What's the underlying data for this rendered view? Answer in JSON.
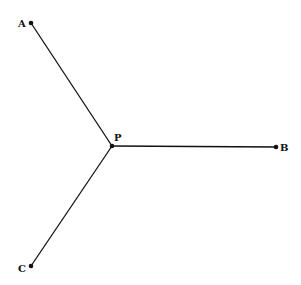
{
  "diagram": {
    "points": [
      {
        "id": "A",
        "label": "A",
        "x": 31,
        "y": 23,
        "lx": 18,
        "ly": 27
      },
      {
        "id": "B",
        "label": "B",
        "x": 276,
        "y": 147,
        "lx": 280,
        "ly": 151
      },
      {
        "id": "C",
        "label": "C",
        "x": 31,
        "y": 266,
        "lx": 18,
        "ly": 272
      },
      {
        "id": "P",
        "label": "P",
        "x": 112,
        "y": 146,
        "lx": 114,
        "ly": 141
      }
    ],
    "segments": [
      [
        "P",
        "A"
      ],
      [
        "P",
        "B"
      ],
      [
        "P",
        "C"
      ]
    ],
    "colors": {
      "line": "#111111",
      "background": "#ffffff"
    }
  }
}
